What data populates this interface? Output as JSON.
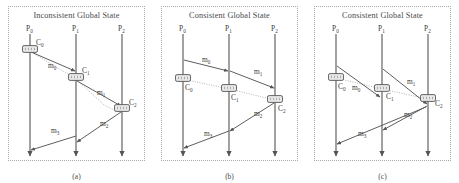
{
  "figure": {
    "width": 459,
    "height": 183,
    "background": "#ffffff",
    "line_color": "#555555",
    "cut_color": "#b4b4b4",
    "box_fill": "#e8e8e8",
    "text_color": "#3a3a3a"
  },
  "panels": [
    {
      "id": "a",
      "title": "Inconsistent Global State",
      "caption": "(a)",
      "processes": [
        {
          "name": "P",
          "sub": "0",
          "x": 30
        },
        {
          "name": "P",
          "sub": "1",
          "x": 76
        },
        {
          "name": "P",
          "sub": "2",
          "x": 122
        }
      ],
      "timeline": {
        "top": 34,
        "bottom": 156
      },
      "checkpoints": [
        {
          "name": "C",
          "sub": "0",
          "x": 30,
          "y": 49,
          "label_dx": 6,
          "label_dy": -4
        },
        {
          "name": "C",
          "sub": "1",
          "x": 76,
          "y": 77,
          "label_dx": 6,
          "label_dy": -4
        },
        {
          "name": "C",
          "sub": "2",
          "x": 122,
          "y": 108,
          "label_dx": 7,
          "label_dy": -3
        }
      ],
      "messages": [
        {
          "name": "m",
          "sub": "0",
          "x1": 31,
          "y1": 52,
          "x2": 75,
          "y2": 71,
          "lx": 48,
          "ly": 68
        },
        {
          "name": "m",
          "sub": "1",
          "x1": 77,
          "y1": 81,
          "x2": 121,
          "y2": 106,
          "lx": 97,
          "ly": 95
        },
        {
          "name": "m",
          "sub": "2",
          "x1": 121,
          "y1": 112,
          "x2": 77,
          "y2": 142,
          "lx": 100,
          "ly": 126
        },
        {
          "name": "m",
          "sub": "3",
          "x1": 76,
          "y1": 136,
          "x2": 31,
          "y2": 150,
          "lx": 51,
          "ly": 133
        }
      ],
      "cut": [
        {
          "x": 30,
          "y": 51
        },
        {
          "x": 76,
          "y": 79
        },
        {
          "x": 104,
          "y": 105
        },
        {
          "x": 118,
          "y": 112
        },
        {
          "x": 124,
          "y": 109
        }
      ]
    },
    {
      "id": "b",
      "title": "Consistent Global State",
      "caption": "(b)",
      "processes": [
        {
          "name": "P",
          "sub": "0",
          "x": 30,
          "label_x": 30
        },
        {
          "name": "P",
          "sub": "1",
          "x": 76,
          "label_x": 76
        },
        {
          "name": "P",
          "sub": "2",
          "x": 122,
          "label_x": 122
        }
      ],
      "timeline": {
        "top": 34,
        "bottom": 156
      },
      "checkpoints": [
        {
          "name": "C",
          "sub": "0",
          "x": 30,
          "y": 78,
          "label_dx": 2,
          "label_dy": 12
        },
        {
          "name": "C",
          "sub": "1",
          "x": 76,
          "y": 88,
          "label_dx": 2,
          "label_dy": 12
        },
        {
          "name": "C",
          "sub": "2",
          "x": 122,
          "y": 99,
          "label_dx": 3,
          "label_dy": 12
        }
      ],
      "messages": [
        {
          "name": "m",
          "sub": "0",
          "x1": 31,
          "y1": 60,
          "x2": 75,
          "y2": 71,
          "lx": 49,
          "ly": 62
        },
        {
          "name": "m",
          "sub": "1",
          "x1": 77,
          "y1": 71,
          "x2": 121,
          "y2": 88,
          "lx": 101,
          "ly": 74
        },
        {
          "name": "m",
          "sub": "2",
          "x1": 121,
          "y1": 103,
          "x2": 77,
          "y2": 131,
          "lx": 101,
          "ly": 116
        },
        {
          "name": "m",
          "sub": "3",
          "x1": 76,
          "y1": 131,
          "x2": 31,
          "y2": 148,
          "lx": 51,
          "ly": 136
        }
      ],
      "cut": [
        {
          "x": 30,
          "y": 79
        },
        {
          "x": 76,
          "y": 89
        },
        {
          "x": 122,
          "y": 100
        }
      ]
    },
    {
      "id": "c",
      "title": "Consistent Global State",
      "caption": "(c)",
      "processes": [
        {
          "name": "P",
          "sub": "0",
          "x": 30
        },
        {
          "name": "P",
          "sub": "1",
          "x": 76
        },
        {
          "name": "P",
          "sub": "2",
          "x": 122
        }
      ],
      "timeline": {
        "top": 34,
        "bottom": 156
      },
      "checkpoints": [
        {
          "name": "C",
          "sub": "0",
          "x": 30,
          "y": 77,
          "label_dx": 2,
          "label_dy": 12
        },
        {
          "name": "C",
          "sub": "1",
          "x": 76,
          "y": 88,
          "label_dx": 4,
          "label_dy": 11
        },
        {
          "name": "C",
          "sub": "2",
          "x": 122,
          "y": 98,
          "label_dx": 7,
          "label_dy": 8
        }
      ],
      "messages": [
        {
          "name": "m",
          "sub": "0",
          "x1": 31,
          "y1": 66,
          "x2": 74,
          "y2": 97,
          "lx": 46,
          "ly": 90
        },
        {
          "name": "m",
          "sub": "1",
          "x1": 77,
          "y1": 69,
          "x2": 121,
          "y2": 104,
          "lx": 101,
          "ly": 84
        },
        {
          "name": "m",
          "sub": "2",
          "x1": 121,
          "y1": 106,
          "x2": 77,
          "y2": 130,
          "lx": 98,
          "ly": 117
        },
        {
          "name": "m",
          "sub": "3",
          "x1": 120,
          "y1": 107,
          "x2": 31,
          "y2": 144,
          "lx": 52,
          "ly": 136
        }
      ],
      "cut": [
        {
          "x": 30,
          "y": 78
        },
        {
          "x": 76,
          "y": 89
        },
        {
          "x": 122,
          "y": 99
        }
      ]
    }
  ]
}
